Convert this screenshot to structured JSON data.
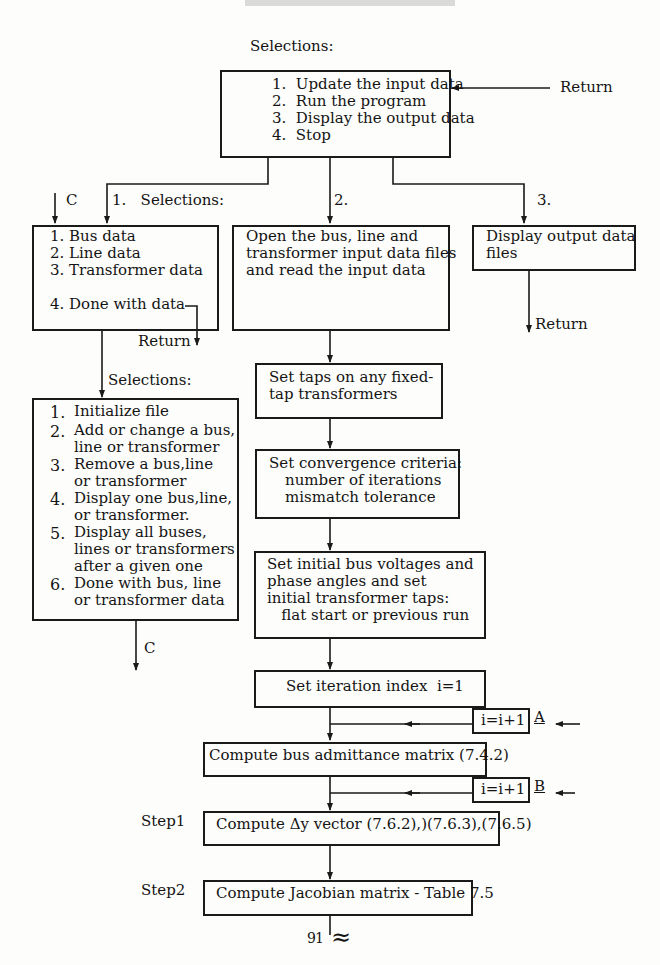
{
  "top": {
    "selections_label": "Selections:",
    "menu": [
      "1.  Update the input data",
      "2.  Run the program",
      "3.  Display the output data",
      "4.  Stop"
    ],
    "return_label": "Return"
  },
  "branches": {
    "b1_label": "1.   Selections:",
    "b2_label": "2.",
    "b3_label": "3.",
    "c_in_label": "C"
  },
  "data_menu": {
    "items": [
      "1. Bus data",
      "2. Line data",
      "3. Transformer data",
      "4. Done with data"
    ],
    "return_label": "Return"
  },
  "open_files": {
    "lines": [
      "Open the bus, line and",
      "transformer input data files",
      "and read the input data"
    ]
  },
  "display_output": {
    "lines": [
      "Display output data",
      "files"
    ],
    "return_label": "Return"
  },
  "edit_menu": {
    "selections_label": "Selections:",
    "items": [
      {
        "num": "1.",
        "lines": [
          "Initialize file"
        ]
      },
      {
        "num": "2.",
        "lines": [
          "Add or change a bus,",
          "line or transformer"
        ]
      },
      {
        "num": "3.",
        "lines": [
          "Remove a bus,line",
          "or transformer"
        ]
      },
      {
        "num": "4.",
        "lines": [
          "Display one bus,line,",
          "or transformer."
        ]
      },
      {
        "num": "5.",
        "lines": [
          "Display all buses,",
          "lines or transformers",
          "after a given one"
        ]
      },
      {
        "num": "6.",
        "lines": [
          "Done with bus, line",
          "or transformer data"
        ]
      }
    ],
    "c_out_label": "C"
  },
  "steps": {
    "set_taps": [
      "Set taps on any fixed-",
      "tap transformers"
    ],
    "convergence": [
      "Set convergence criteria:",
      "number of iterations",
      "mismatch tolerance"
    ],
    "initial": [
      "Set initial bus voltages and",
      "phase angles and set",
      "initial transformer taps:",
      "   flat start or previous run"
    ],
    "iteration_index": "Set iteration index  i=1",
    "increment_a": "i=i+1",
    "label_a": "A",
    "admittance": "Compute bus admittance matrix (7.4.2)",
    "increment_b": "i=i+1",
    "label_b": "B",
    "step1_label": "Step1",
    "step1": "Compute Δy vector (7.6.2),)(7.6.3),(7.6.5)",
    "step2_label": "Step2",
    "step2": "Compute Jacobian matrix - Table 7.5"
  },
  "footer": {
    "page_number": "91",
    "break_symbol": "≈"
  }
}
